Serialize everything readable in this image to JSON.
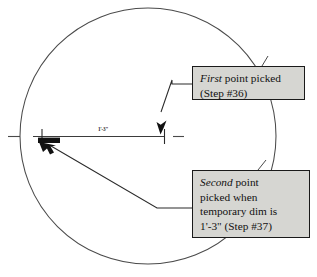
{
  "diagram": {
    "colors": {
      "line": "#3b3b3b",
      "geometry": "#4a4a4a",
      "callout_fill": "#d6d6d2",
      "callout_border": "#1a1a1a",
      "marker_fill": "#111111",
      "text": "#111111"
    },
    "circle": {
      "center_x": 148,
      "center_y": 136,
      "radius": 128
    },
    "dimension": {
      "label": "1'-3\"",
      "line_y": 136,
      "start_x": 38,
      "end_x": 164
    },
    "callouts": [
      {
        "id": "first",
        "emphasis": "First",
        "lines": [
          "First point picked",
          "(Step #36)"
        ],
        "line1_rest": " point picked",
        "line2": "(Step #36)"
      },
      {
        "id": "second",
        "emphasis": "Second",
        "lines": [
          "Second point",
          "picked when",
          "temporary dim is",
          "1'-3\" (Step #37)"
        ],
        "line1_rest": " point",
        "line2": "picked when",
        "line3": "temporary dim is",
        "line4": "1'-3\" (Step #37)"
      }
    ],
    "markers": {
      "first_point_icon": "down-arrow-pointer",
      "second_point_icon": "up-left-arrow-pointer",
      "snap_marker_icon": "filled-rectangle-marker"
    }
  }
}
